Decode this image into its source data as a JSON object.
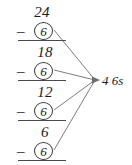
{
  "diagram": {
    "type": "repeated-subtraction",
    "title": "",
    "start_value": "24",
    "operator": "–",
    "subtrahend": "6",
    "steps": [
      {
        "minus": "–",
        "subtrahend": "6",
        "result": "18"
      },
      {
        "minus": "–",
        "subtrahend": "6",
        "result": "12"
      },
      {
        "minus": "–",
        "subtrahend": "6",
        "result": "6"
      },
      {
        "minus": "–",
        "subtrahend": "6",
        "result": "0"
      }
    ],
    "annotation": "4 6s",
    "colors": {
      "ink": "#1b1b1b",
      "rule": "#4a4a4a",
      "circle": "#3a3a3a",
      "connector": "#6e6e6e",
      "background": "#ffffff"
    }
  }
}
